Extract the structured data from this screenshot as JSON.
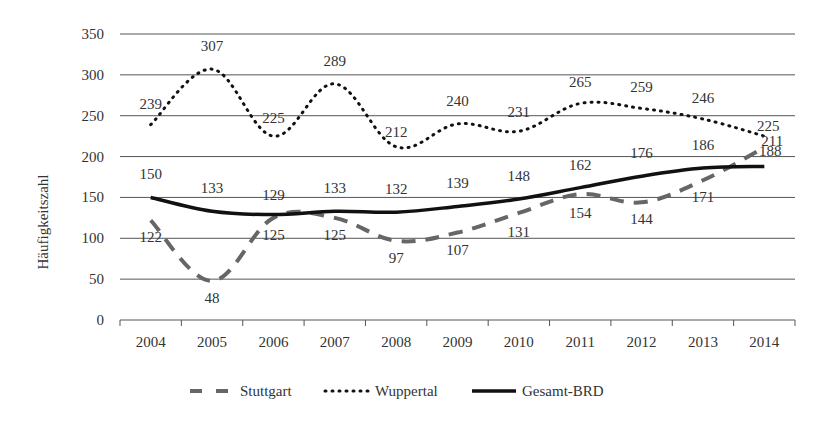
{
  "chart_data": {
    "type": "line",
    "title": "",
    "xlabel": "",
    "ylabel": "Häufigkeitszahl",
    "ylim": [
      0,
      350
    ],
    "yticks": [
      0,
      50,
      100,
      150,
      200,
      250,
      300,
      350
    ],
    "grid": true,
    "legend_position": "bottom",
    "categories": [
      "2004",
      "2005",
      "2006",
      "2007",
      "2008",
      "2009",
      "2010",
      "2011",
      "2012",
      "2013",
      "2014"
    ],
    "series": [
      {
        "name": "Stuttgart",
        "style": "dashed",
        "color": "#666666",
        "values": [
          122,
          48,
          125,
          125,
          97,
          107,
          131,
          154,
          144,
          171,
          211
        ]
      },
      {
        "name": "Wuppertal",
        "style": "dotted",
        "color": "#111111",
        "values": [
          239,
          307,
          225,
          289,
          212,
          240,
          231,
          265,
          259,
          246,
          225
        ]
      },
      {
        "name": "Gesamt-BRD",
        "style": "solid",
        "color": "#111111",
        "values": [
          150,
          133,
          129,
          133,
          132,
          139,
          148,
          162,
          176,
          186,
          188
        ]
      }
    ]
  }
}
